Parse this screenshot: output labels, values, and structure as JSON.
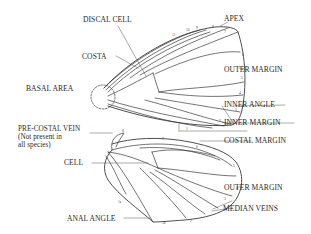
{
  "diagram": {
    "type": "butterfly wing anatomy",
    "forewing": {
      "labels": [
        {
          "id": "discal-cell",
          "text": "DISCAL CELL"
        },
        {
          "id": "costa",
          "text": "COSTA"
        },
        {
          "id": "basal-area",
          "text": "BASAL AREA"
        },
        {
          "id": "apex",
          "text": "APEX"
        },
        {
          "id": "outer-margin",
          "text": "OUTER MARGIN"
        },
        {
          "id": "inner-angle",
          "text": "INNER ANGLE"
        },
        {
          "id": "inner-margin",
          "text": "INNER MARGIN"
        }
      ],
      "vein_numbers": [
        "11",
        "10",
        "9",
        "8",
        "7",
        "6",
        "5",
        "4",
        "3",
        "2",
        "1"
      ]
    },
    "hindwing": {
      "labels": [
        {
          "id": "pre-costal-vein",
          "text": "PRE-COSTAL VEIN",
          "note_line1": "(Not present in",
          "note_line2": "all species)"
        },
        {
          "id": "costal-margin",
          "text": "COSTAL MARGIN"
        },
        {
          "id": "cell",
          "text": "CELL"
        },
        {
          "id": "outer-margin",
          "text": "OUTER MARGIN"
        },
        {
          "id": "median-veins",
          "text": "MEDIAN VEINS"
        },
        {
          "id": "anal-angle",
          "text": "ANAL ANGLE"
        }
      ],
      "vein_numbers": [
        "8",
        "7",
        "6",
        "5",
        "4",
        "3",
        "2",
        "1b",
        "1a"
      ]
    },
    "colors": {
      "line": "#3a3a3a",
      "text": "#2a2a2a",
      "background": "#ffffff"
    }
  }
}
